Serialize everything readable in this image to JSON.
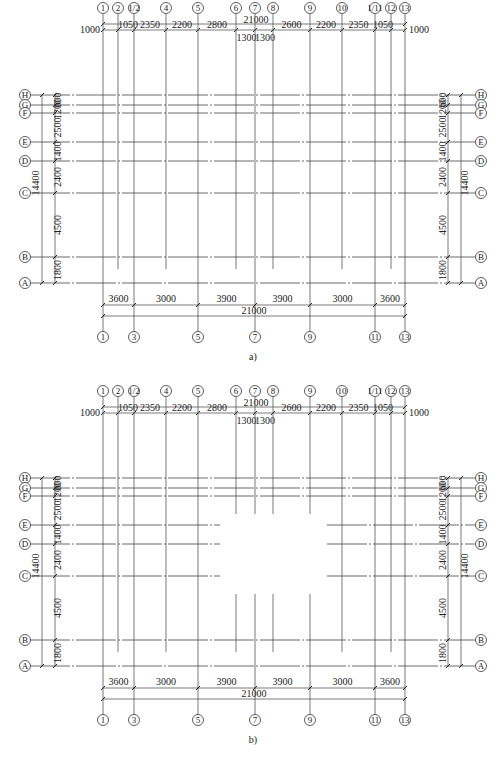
{
  "figures": [
    {
      "caption": "a)",
      "variant": "full",
      "top_axes": [
        "1",
        "2",
        "1/2",
        "4",
        "5",
        "6",
        "7",
        "8",
        "9",
        "10",
        "1/11",
        "12",
        "13"
      ],
      "top_dims": {
        "left_edge": "1000",
        "right_edge": "1000",
        "total": "21000",
        "segments": [
          "1050",
          "2350",
          "2200",
          "2800",
          "2600",
          "2200",
          "2350",
          "1050"
        ],
        "center_segments": [
          "1300",
          "1300"
        ]
      },
      "bottom_axes": [
        "1",
        "3",
        "5",
        "7",
        "9",
        "11",
        "13"
      ],
      "bottom_dims": {
        "segments": [
          "3600",
          "3000",
          "3900",
          "3900",
          "3000",
          "3600"
        ],
        "total": "21000"
      },
      "row_axes": [
        "H",
        "G",
        "F",
        "E",
        "D",
        "C",
        "B",
        "A"
      ],
      "row_dims": {
        "segments": [
          "600",
          "1200",
          "2500",
          "1400",
          "2400",
          "4500",
          "1800"
        ],
        "total": "14400"
      }
    },
    {
      "caption": "b)",
      "variant": "open-center",
      "top_axes": [
        "1",
        "2",
        "1/2",
        "4",
        "5",
        "6",
        "7",
        "8",
        "9",
        "10",
        "1/11",
        "12",
        "13"
      ],
      "top_dims": {
        "left_edge": "1000",
        "right_edge": "1000",
        "total": "21000",
        "segments": [
          "1050",
          "2350",
          "2200",
          "2800",
          "2600",
          "2200",
          "2350",
          "1050"
        ],
        "center_segments": [
          "1300",
          "1300"
        ]
      },
      "bottom_axes": [
        "1",
        "3",
        "5",
        "7",
        "9",
        "11",
        "13"
      ],
      "bottom_dims": {
        "segments": [
          "3600",
          "3000",
          "3900",
          "3900",
          "3000",
          "3600"
        ],
        "total": "21000"
      },
      "row_axes": [
        "H",
        "G",
        "F",
        "E",
        "D",
        "C",
        "B",
        "A"
      ],
      "row_dims": {
        "segments": [
          "600",
          "1200",
          "2500",
          "1400",
          "2400",
          "4500",
          "1800"
        ],
        "total": "14400"
      }
    }
  ]
}
